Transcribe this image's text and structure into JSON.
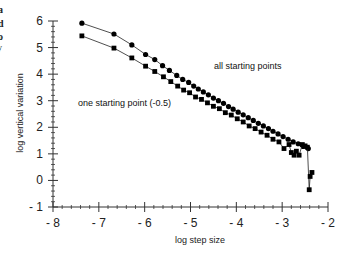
{
  "edge_fragments": [
    "a",
    "d",
    "o",
    "y"
  ],
  "chart_data": {
    "type": "line",
    "title": "",
    "xlabel": "log step size",
    "ylabel": "log vertical variation",
    "xlim": [
      -8,
      -2
    ],
    "ylim": [
      -1,
      6
    ],
    "xticks": [
      -8,
      -7,
      -6,
      -5,
      -4,
      -3,
      -2
    ],
    "xtick_labels": [
      "- 8",
      "- 7",
      "- 6",
      "- 5",
      "- 4",
      "- 3",
      "- 2"
    ],
    "yticks": [
      -1,
      0,
      1,
      2,
      3,
      4,
      5,
      6
    ],
    "ytick_labels": [
      "- 1",
      "0",
      "1",
      "2",
      "3",
      "4",
      "5",
      "6"
    ],
    "grid": false,
    "legend": "none (inline annotations)",
    "annotations": [
      {
        "text": "all starting points",
        "x": -4.5,
        "y": 4.4
      },
      {
        "text": "one starting point  (-0.5)",
        "x": -7.0,
        "y": 2.9
      }
    ],
    "series": [
      {
        "name": "all starting points",
        "marker": "circle",
        "x": [
          -7.37,
          -6.67,
          -6.28,
          -5.98,
          -5.78,
          -5.61,
          -5.46,
          -5.3,
          -5.17,
          -5.04,
          -4.93,
          -4.83,
          -4.72,
          -4.61,
          -4.5,
          -4.39,
          -4.28,
          -4.17,
          -4.07,
          -3.96,
          -3.85,
          -3.74,
          -3.63,
          -3.52,
          -3.41,
          -3.3,
          -3.2,
          -3.09,
          -2.98,
          -2.87,
          -2.76,
          -2.65,
          -2.54,
          -2.43
        ],
        "y": [
          5.92,
          5.51,
          5.1,
          4.74,
          4.55,
          4.32,
          4.14,
          3.95,
          3.8,
          3.69,
          3.55,
          3.44,
          3.33,
          3.22,
          3.1,
          3.0,
          2.9,
          2.78,
          2.68,
          2.57,
          2.47,
          2.36,
          2.26,
          2.15,
          2.05,
          1.95,
          1.85,
          1.75,
          1.65,
          1.55,
          1.45,
          1.38,
          1.28,
          1.2
        ]
      },
      {
        "name": "one starting point (-0.5)",
        "marker": "square",
        "x": [
          -7.37,
          -6.67,
          -6.28,
          -5.98,
          -5.78,
          -5.59,
          -5.43,
          -5.28,
          -5.15,
          -5.02,
          -4.89,
          -4.76,
          -4.63,
          -4.5,
          -4.37,
          -4.24,
          -4.11,
          -3.98,
          -3.85,
          -3.72,
          -3.59,
          -3.46,
          -3.33,
          -3.2,
          -3.07,
          -2.96,
          -2.85,
          -2.8,
          -2.74,
          -2.69,
          -2.63,
          -2.56,
          -2.5,
          -2.45,
          -2.41,
          -2.39,
          -2.35
        ],
        "y": [
          5.44,
          4.98,
          4.61,
          4.3,
          4.1,
          3.9,
          3.72,
          3.55,
          3.4,
          3.3,
          3.14,
          3.05,
          2.92,
          2.79,
          2.7,
          2.55,
          2.46,
          2.32,
          2.2,
          2.05,
          1.95,
          1.82,
          1.7,
          1.55,
          1.45,
          1.2,
          1.35,
          1.05,
          0.95,
          1.1,
          0.95,
          1.35,
          1.3,
          1.25,
          -0.35,
          0.15,
          0.3
        ]
      }
    ]
  }
}
